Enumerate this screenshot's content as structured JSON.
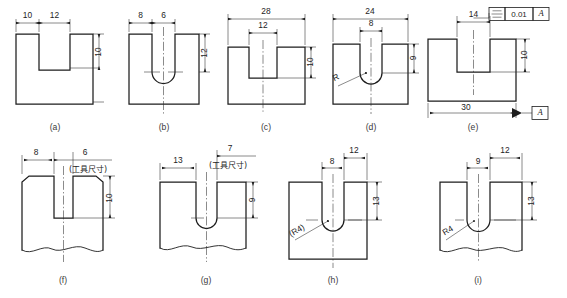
{
  "sheet": {
    "title": "Keyway / slot dimensioning comparison plate",
    "background_color": "#ffffff",
    "line_color": "#1d1d1d"
  },
  "figures": [
    {
      "id": "a",
      "label": "(a)",
      "type": "rectangular-slot-block",
      "dimensions": [
        {
          "name": "left-offset",
          "value": "10"
        },
        {
          "name": "slot-width",
          "value": "12"
        },
        {
          "name": "slot-depth",
          "value": "10"
        }
      ],
      "notes": []
    },
    {
      "id": "b",
      "label": "(b)",
      "type": "round-bottom-slot-block",
      "dimensions": [
        {
          "name": "left-offset",
          "value": "8"
        },
        {
          "name": "slot-width",
          "value": "6"
        },
        {
          "name": "slot-depth",
          "value": "12"
        }
      ],
      "notes": []
    },
    {
      "id": "c",
      "label": "(c)",
      "type": "rectangular-slot-block",
      "dimensions": [
        {
          "name": "overall-width",
          "value": "28"
        },
        {
          "name": "slot-width",
          "value": "12"
        },
        {
          "name": "slot-depth",
          "value": "10"
        }
      ],
      "notes": []
    },
    {
      "id": "d",
      "label": "(d)",
      "type": "round-bottom-slot-block",
      "dimensions": [
        {
          "name": "overall-width",
          "value": "24"
        },
        {
          "name": "slot-width",
          "value": "8"
        },
        {
          "name": "slot-depth",
          "value": "9"
        },
        {
          "name": "radius-leader",
          "value": "R"
        }
      ],
      "notes": []
    },
    {
      "id": "e",
      "label": "(e)",
      "type": "rectangular-slot-block-with-tolerance",
      "dimensions": [
        {
          "name": "slot-width",
          "value": "14"
        },
        {
          "name": "slot-depth",
          "value": "10"
        },
        {
          "name": "overall-width",
          "value": "30"
        }
      ],
      "tolerance_frame": {
        "symbol": "symmetry-icon",
        "value": "0.01",
        "datum": "A"
      },
      "datum_label": "A",
      "notes": []
    },
    {
      "id": "f",
      "label": "(f)",
      "type": "shaft-keyseat-chamfered",
      "dimensions": [
        {
          "name": "left-offset",
          "value": "8"
        },
        {
          "name": "tool-width",
          "value": "6"
        },
        {
          "name": "slot-depth",
          "value": "10"
        }
      ],
      "notes": [
        {
          "name": "tool-size-note",
          "value": "(工具尺寸)"
        }
      ]
    },
    {
      "id": "g",
      "label": "(g)",
      "type": "shaft-keyseat-round-bottom",
      "dimensions": [
        {
          "name": "tool-width",
          "value": "7"
        },
        {
          "name": "left-offset",
          "value": "13"
        },
        {
          "name": "slot-depth",
          "value": "9"
        }
      ],
      "notes": [
        {
          "name": "tool-size-note",
          "value": "(工具尺寸)"
        }
      ]
    },
    {
      "id": "h",
      "label": "(h)",
      "type": "block-keyseat-round-bottom",
      "dimensions": [
        {
          "name": "right-offset",
          "value": "12"
        },
        {
          "name": "slot-width",
          "value": "8"
        },
        {
          "name": "slot-depth",
          "value": "13"
        },
        {
          "name": "radius-leader",
          "value": "(R4)"
        }
      ],
      "notes": []
    },
    {
      "id": "i",
      "label": "(i)",
      "type": "shaft-keyseat-round-bottom",
      "dimensions": [
        {
          "name": "right-offset",
          "value": "12"
        },
        {
          "name": "slot-width",
          "value": "9"
        },
        {
          "name": "slot-depth",
          "value": "13"
        },
        {
          "name": "radius-leader",
          "value": "R4"
        }
      ],
      "notes": []
    }
  ]
}
